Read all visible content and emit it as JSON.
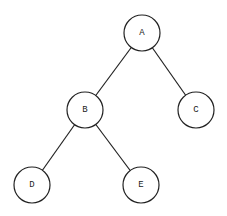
{
  "diagram": {
    "type": "binary-tree",
    "stroke_color": "#222222",
    "background": "#ffffff",
    "node_radius": 18,
    "nodes": [
      {
        "id": "A",
        "label": "A",
        "cx": 142,
        "cy": 33
      },
      {
        "id": "B",
        "label": "B",
        "cx": 85,
        "cy": 110
      },
      {
        "id": "C",
        "label": "C",
        "cx": 196,
        "cy": 110
      },
      {
        "id": "D",
        "label": "D",
        "cx": 32,
        "cy": 185
      },
      {
        "id": "E",
        "label": "E",
        "cx": 141,
        "cy": 185
      }
    ],
    "edges": [
      {
        "from": "A",
        "to": "B"
      },
      {
        "from": "A",
        "to": "C"
      },
      {
        "from": "B",
        "to": "D"
      },
      {
        "from": "B",
        "to": "E"
      }
    ]
  }
}
